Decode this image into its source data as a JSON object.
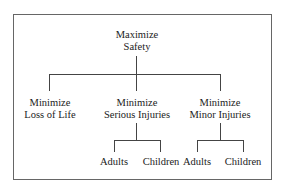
{
  "diagram": {
    "type": "hierarchy-tree",
    "root": {
      "line1": "Maximize",
      "line2": "Safety"
    },
    "children": [
      {
        "line1": "Minimize",
        "line2": "Loss of Life",
        "children": []
      },
      {
        "line1": "Minimize",
        "line2": "Serious Injuries",
        "children": [
          {
            "label": "Adults"
          },
          {
            "label": "Children"
          }
        ]
      },
      {
        "line1": "Minimize",
        "line2": "Minor Injuries",
        "children": [
          {
            "label": "Adults"
          },
          {
            "label": "Children"
          }
        ]
      }
    ]
  }
}
